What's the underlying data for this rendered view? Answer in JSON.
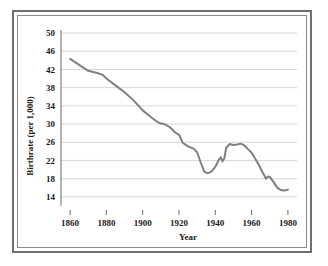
{
  "chart_data": {
    "type": "line",
    "title": "",
    "xlabel": "Year",
    "ylabel": "Birthrate (per 1,000)",
    "xlim": [
      1855,
      1985
    ],
    "ylim": [
      12,
      50
    ],
    "grid": true,
    "legend_position": "none",
    "line_color": "#808080",
    "grid_color": "#d8d8d8",
    "axis_color": "#6b6b6b",
    "xticks": [
      1860,
      1880,
      1900,
      1920,
      1940,
      1960,
      1980
    ],
    "xtick_labels": [
      "1860",
      "1880",
      "1900",
      "1920",
      "1940",
      "1960",
      "1980"
    ],
    "yticks": [
      14,
      18,
      22,
      26,
      30,
      34,
      38,
      42,
      46,
      50
    ],
    "ytick_labels": [
      "14",
      "18",
      "22",
      "26",
      "30",
      "34",
      "38",
      "42",
      "46",
      "50"
    ],
    "series": [
      {
        "name": "Birthrate (per 1,000)",
        "x": [
          1860,
          1865,
          1870,
          1875,
          1878,
          1880,
          1885,
          1890,
          1895,
          1900,
          1905,
          1908,
          1910,
          1912,
          1915,
          1918,
          1920,
          1922,
          1925,
          1928,
          1930,
          1932,
          1934,
          1936,
          1938,
          1940,
          1942,
          1943,
          1944,
          1945,
          1946,
          1948,
          1950,
          1952,
          1954,
          1956,
          1958,
          1960,
          1962,
          1964,
          1966,
          1968,
          1969,
          1970,
          1972,
          1974,
          1976,
          1978,
          1980
        ],
        "y": [
          44.3,
          43.0,
          41.7,
          41.2,
          40.8,
          40.0,
          38.5,
          37.0,
          35.2,
          33.0,
          31.4,
          30.5,
          30.1,
          30.0,
          29.3,
          28.1,
          27.7,
          25.9,
          25.1,
          24.6,
          23.8,
          21.5,
          19.5,
          19.2,
          19.6,
          20.6,
          22.2,
          22.7,
          21.8,
          22.5,
          24.8,
          25.6,
          25.4,
          25.5,
          25.7,
          25.3,
          24.5,
          23.7,
          22.4,
          21.0,
          19.4,
          18.0,
          18.5,
          18.4,
          17.3,
          16.1,
          15.5,
          15.4,
          15.6
        ]
      }
    ]
  }
}
